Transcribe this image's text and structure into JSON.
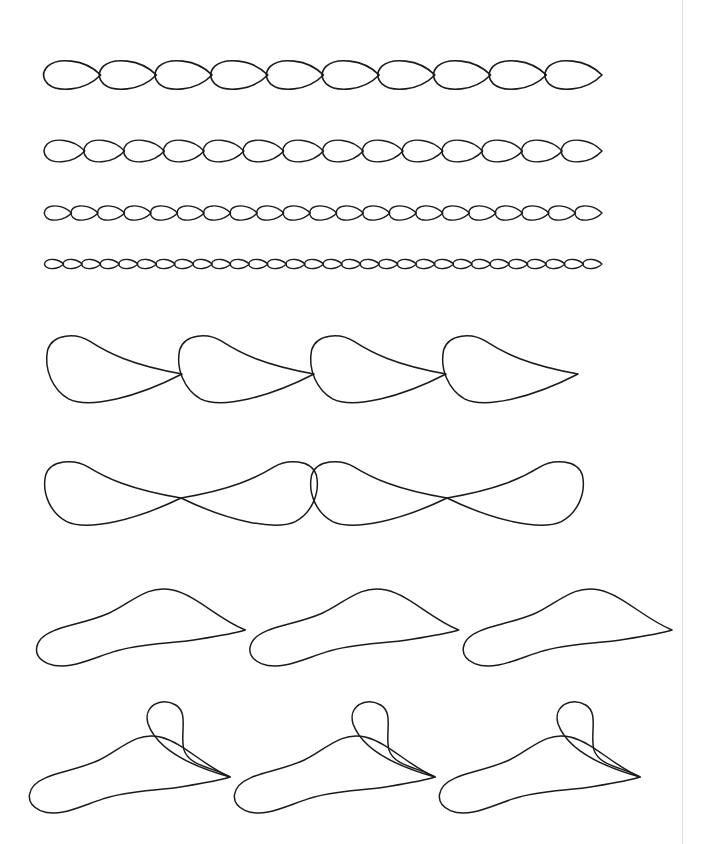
{
  "canvas": {
    "width": 702,
    "height": 844,
    "background_color": "#ffffff",
    "page_edge_color": "#dcdcdc",
    "page_edge_x": 683
  },
  "ink": {
    "stroke_color": "#1a1a1a",
    "fill": "none"
  },
  "sheet": {
    "title": "Decorative Stroke Pattern Sheet",
    "row_count": 8
  },
  "rows": [
    {
      "id": "row-1",
      "name": "teardrop-chain-large",
      "kind": "teardrop-chain",
      "baseline_y": 75,
      "start_x": 45,
      "end_x": 602,
      "repeat_count": 10,
      "unit_width": 55.7,
      "loop_height": 34,
      "stroke_width": 1.6
    },
    {
      "id": "row-2",
      "name": "teardrop-chain-medium",
      "kind": "teardrop-chain",
      "baseline_y": 151,
      "start_x": 45,
      "end_x": 602,
      "repeat_count": 14,
      "unit_width": 39.8,
      "loop_height": 26,
      "stroke_width": 1.5
    },
    {
      "id": "row-3",
      "name": "teardrop-chain-small",
      "kind": "teardrop-chain",
      "baseline_y": 213,
      "start_x": 45,
      "end_x": 602,
      "repeat_count": 21,
      "unit_width": 26.5,
      "loop_height": 17,
      "stroke_width": 1.4
    },
    {
      "id": "row-4",
      "name": "teardrop-chain-tiny",
      "kind": "teardrop-chain",
      "baseline_y": 264,
      "start_x": 45,
      "end_x": 602,
      "repeat_count": 30,
      "unit_width": 18.6,
      "loop_height": 11,
      "stroke_width": 1.3
    },
    {
      "id": "row-5",
      "name": "swoosh-leaf-chain",
      "kind": "swoosh-leaf",
      "baseline_y": 374,
      "start_x": 50,
      "end_x": 578,
      "repeat_count": 4,
      "unit_width": 132,
      "loop_height": 40,
      "stroke_width": 1.5
    },
    {
      "id": "row-6",
      "name": "mirrored-swoosh-pair-chain",
      "kind": "mirrored-pair",
      "baseline_y": 498,
      "start_x": 48,
      "end_x": 580,
      "repeat_count": 2,
      "unit_width": 266,
      "loop_height": 38,
      "stroke_width": 1.5
    },
    {
      "id": "row-7",
      "name": "s-ribbon-chain",
      "kind": "s-ribbon",
      "baseline_y": 630,
      "start_x": 32,
      "end_x": 672,
      "repeat_count": 3,
      "unit_width": 213,
      "loop_height": 42,
      "stroke_width": 1.5
    },
    {
      "id": "row-8",
      "name": "s-ribbon-with-flourish-chain",
      "kind": "s-ribbon-flourish",
      "baseline_y": 777,
      "start_x": 25,
      "end_x": 640,
      "repeat_count": 3,
      "unit_width": 205,
      "loop_height": 42,
      "flourish_height": 72,
      "stroke_width": 1.5
    }
  ]
}
